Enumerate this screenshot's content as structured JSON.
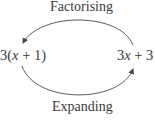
{
  "diagram": {
    "top_label": "Factorising",
    "bottom_label": "Expanding",
    "left_expr": {
      "coef": "3(",
      "var": "x",
      "rest": " + 1)"
    },
    "right_expr": {
      "coef": "3",
      "var": "x",
      "rest": " + 3"
    },
    "arrow_color": "#4a4a4a",
    "text_color": "#3a3a3a"
  }
}
